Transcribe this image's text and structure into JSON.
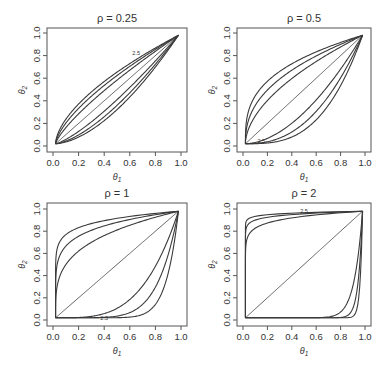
{
  "chart_data": [
    {
      "type": "line",
      "title": "ρ = 0.25",
      "rho": 0.25,
      "xlabel": "θ1",
      "ylabel": "θ2",
      "xlim": [
        0,
        1
      ],
      "ylim": [
        0,
        1
      ],
      "xticks": [
        "0.0",
        "0.2",
        "0.4",
        "0.6",
        "0.8",
        "1.0"
      ],
      "yticks": [
        "0.0",
        "0.2",
        "0.4",
        "0.6",
        "0.8",
        "1.0"
      ],
      "grid": false,
      "contour_label": "2.5",
      "series_exponents": [
        0.6,
        0.67,
        0.77,
        1.0,
        1.3,
        1.5,
        1.67
      ],
      "series_description": "Family of curves from (0,0) to (1,1); diagonal plus three bowed above and three bowed below"
    },
    {
      "type": "line",
      "title": "ρ = 0.5",
      "rho": 0.5,
      "xlabel": "θ1",
      "ylabel": "θ2",
      "xlim": [
        0,
        1
      ],
      "ylim": [
        0,
        1
      ],
      "xticks": [
        "0.0",
        "0.2",
        "0.4",
        "0.6",
        "0.8",
        "1.0"
      ],
      "yticks": [
        "0.0",
        "0.2",
        "0.4",
        "0.6",
        "0.8",
        "1.0"
      ],
      "grid": false,
      "contour_label": "2.5",
      "series_exponents": [
        0.33,
        0.42,
        0.55,
        1.0,
        1.8,
        2.4,
        3.0
      ],
      "series_description": "Family of curves from (0,0) to (1,1); stronger bowing than ρ=0.25"
    },
    {
      "type": "line",
      "title": "ρ = 1",
      "rho": 1,
      "xlabel": "θ1",
      "ylabel": "θ2",
      "xlim": [
        0,
        1
      ],
      "ylim": [
        0,
        1
      ],
      "xticks": [
        "0.0",
        "0.2",
        "0.4",
        "0.6",
        "0.8",
        "1.0"
      ],
      "yticks": [
        "0.0",
        "0.2",
        "0.4",
        "0.6",
        "0.8",
        "1.0"
      ],
      "grid": false,
      "contour_label": "2.5",
      "series_exponents": [
        0.1,
        0.16,
        0.28,
        1.0,
        3.5,
        6.0,
        10.0
      ],
      "series_description": "Curves hug the left/top and bottom/right edges of the unit square"
    },
    {
      "type": "line",
      "title": "ρ = 2",
      "rho": 2,
      "xlabel": "θ1",
      "ylabel": "θ2",
      "xlim": [
        0,
        1
      ],
      "ylim": [
        0,
        1
      ],
      "xticks": [
        "0.0",
        "0.2",
        "0.4",
        "0.6",
        "0.8",
        "1.0"
      ],
      "yticks": [
        "0.0",
        "0.2",
        "0.4",
        "0.6",
        "0.8",
        "1.0"
      ],
      "grid": false,
      "contour_label": "2.5",
      "series_exponents": [
        0.02,
        0.035,
        0.07,
        1.0,
        14,
        28,
        50
      ],
      "series_description": "Curves nearly coincide with the edges of the unit square; diagonal remains"
    }
  ]
}
